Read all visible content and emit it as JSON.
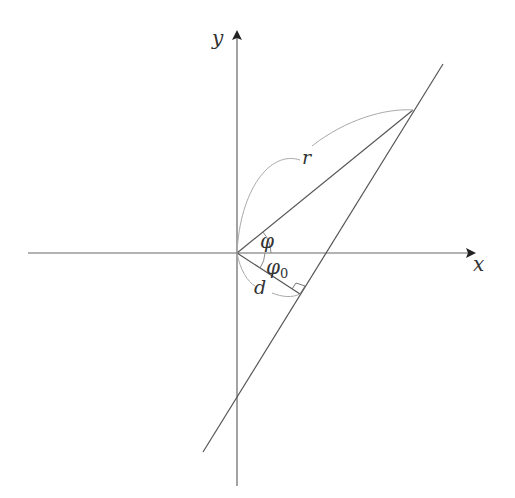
{
  "diagram": {
    "labels": {
      "x_axis": "x",
      "y_axis": "y",
      "radius": "r",
      "angle_phi": "φ",
      "angle_phi0_base": "φ",
      "angle_phi0_sub": "0",
      "distance": "d"
    },
    "colors": {
      "axis": "#555555",
      "line": "#555555",
      "arc": "#b0b0b0",
      "text": "#333333"
    },
    "geometry": {
      "origin": [
        237,
        253
      ],
      "point_P": [
        413,
        110
      ],
      "foot_of_perpendicular": [
        300,
        294
      ],
      "line_endpoints": [
        [
          443,
          64
        ],
        [
          203,
          452
        ]
      ]
    }
  }
}
